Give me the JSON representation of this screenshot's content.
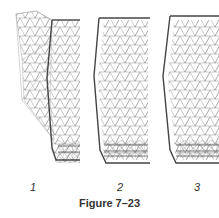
{
  "figure": {
    "caption": "Figure 7–23",
    "panels": [
      {
        "label": "1",
        "x": 33
      },
      {
        "label": "2",
        "x": 120
      },
      {
        "label": "3",
        "x": 197
      }
    ]
  },
  "colors": {
    "mesh": "#888888",
    "outline": "#444444",
    "text": "#333333"
  }
}
